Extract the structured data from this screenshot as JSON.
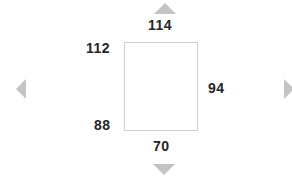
{
  "widget": {
    "name": "margin-adjust-widget",
    "background_color": "#ffffff"
  },
  "crop_rect": {
    "name": "page-rectangle",
    "fill_color": "#ffffff",
    "border_color": "#cfcfcf"
  },
  "labels": {
    "top": "114",
    "left": "112",
    "bottom_left": "88",
    "right": "94",
    "bottom": "70",
    "text_color": "#262626"
  },
  "arrows": {
    "color": "#c4c4c4",
    "up": "triangle-up-icon",
    "down": "triangle-down-icon",
    "left": "triangle-left-icon",
    "right": "triangle-right-icon"
  }
}
